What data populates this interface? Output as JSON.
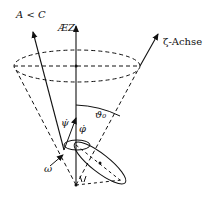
{
  "labels": {
    "a_less_c": "A < C",
    "lz": "ÆZ",
    "zeta_axis": "ζ-Achse",
    "theta0": "ϑ₀",
    "psi_dot": "ψ̇",
    "phi_dot": "φ̇",
    "omega": "ω"
  },
  "colors": {
    "stroke": "#111111",
    "background": "#ffffff"
  }
}
